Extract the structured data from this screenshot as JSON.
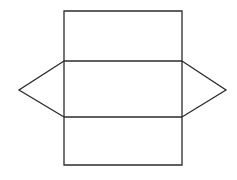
{
  "canvas": {
    "width": 237,
    "height": 180,
    "background_color": "#ffffff",
    "title": "Geometric line figure: rectangle with inscribed horizontal bands and lateral diamond points"
  },
  "style": {
    "stroke_color": "#2b2b2b",
    "stroke_width": 1.3,
    "fill": "none"
  },
  "figure": {
    "name": "rectangle-with-hexagonal-overlay",
    "key_points": {
      "rect_left_x": 64,
      "rect_right_x": 182,
      "rect_top_y": 11,
      "rect_bottom_y": 165,
      "band_upper_y": 61,
      "band_lower_y": 117,
      "left_apex_x": 19,
      "right_apex_x": 226,
      "apex_y": 90
    },
    "shapes": [
      {
        "name": "outer-rectangle",
        "type": "polygon",
        "points": "64,11 182,11 182,165 64,165"
      },
      {
        "name": "upper-divider-line",
        "type": "line",
        "points": "64,61 182,61"
      },
      {
        "name": "lower-divider-line",
        "type": "line",
        "points": "64,117 182,117"
      },
      {
        "name": "left-diamond-point",
        "type": "polyline",
        "points": "64,61 19,90 64,117"
      },
      {
        "name": "right-diamond-point",
        "type": "polyline",
        "points": "182,61 226,90 182,117"
      }
    ]
  }
}
